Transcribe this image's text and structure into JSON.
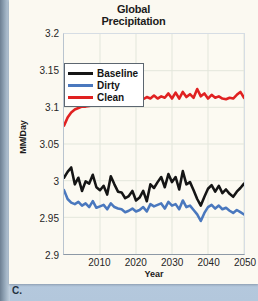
{
  "figure": {
    "caption_letter": "C.",
    "panel_background": "#fbf9f1",
    "page_background": "#bed0e2"
  },
  "chart_data": {
    "type": "line",
    "title": "Global Precipitation",
    "title_lines": [
      "Global",
      "Precipitation"
    ],
    "xlabel": "Year",
    "ylabel": "MM/Day",
    "xlim": [
      2000,
      2050
    ],
    "ylim": [
      2.9,
      3.2
    ],
    "grid": true,
    "legend_position": "upper-left-inside",
    "xticks": [
      2010,
      2020,
      2030,
      2040,
      2050
    ],
    "xtick_labels": [
      "2010",
      "2020",
      "2030",
      "2040",
      "2050"
    ],
    "yticks": [
      2.9,
      2.95,
      3.0,
      3.05,
      3.1,
      3.15,
      3.2
    ],
    "ytick_labels": [
      "2.9",
      "2.95",
      "3",
      "3.05",
      "3.1",
      "3.15",
      "3.2"
    ],
    "x": [
      2000,
      2001,
      2002,
      2003,
      2004,
      2005,
      2006,
      2007,
      2008,
      2009,
      2010,
      2011,
      2012,
      2013,
      2014,
      2015,
      2016,
      2017,
      2018,
      2019,
      2020,
      2021,
      2022,
      2023,
      2024,
      2025,
      2026,
      2027,
      2028,
      2029,
      2030,
      2031,
      2032,
      2033,
      2034,
      2035,
      2036,
      2037,
      2038,
      2039,
      2040,
      2041,
      2042,
      2043,
      2044,
      2045,
      2046,
      2047,
      2048,
      2049,
      2050
    ],
    "series": [
      {
        "name": "Baseline",
        "color": "#151515",
        "values": [
          3.004,
          3.012,
          3.018,
          2.995,
          3.004,
          2.986,
          2.999,
          2.996,
          3.008,
          2.991,
          2.987,
          2.993,
          2.981,
          3.006,
          2.995,
          2.985,
          2.984,
          2.976,
          2.979,
          2.986,
          2.973,
          2.977,
          2.986,
          2.972,
          2.995,
          2.99,
          2.998,
          3.005,
          2.991,
          3.009,
          2.998,
          3.005,
          2.988,
          3.013,
          2.995,
          2.998,
          2.987,
          2.975,
          2.966,
          2.978,
          2.989,
          2.994,
          2.985,
          2.993,
          2.983,
          2.988,
          2.982,
          2.978,
          2.985,
          2.99,
          2.996
        ]
      },
      {
        "name": "Dirty",
        "color": "#4a78be",
        "values": [
          2.987,
          2.975,
          2.97,
          2.968,
          2.971,
          2.966,
          2.969,
          2.964,
          2.972,
          2.963,
          2.965,
          2.967,
          2.961,
          2.969,
          2.964,
          2.962,
          2.961,
          2.957,
          2.959,
          2.962,
          2.958,
          2.96,
          2.964,
          2.958,
          2.968,
          2.965,
          2.967,
          2.969,
          2.962,
          2.971,
          2.966,
          2.968,
          2.961,
          2.973,
          2.964,
          2.966,
          2.96,
          2.954,
          2.945,
          2.956,
          2.964,
          2.967,
          2.962,
          2.966,
          2.961,
          2.963,
          2.959,
          2.956,
          2.96,
          2.957,
          2.954
        ]
      },
      {
        "name": "Clean",
        "color": "#e02121",
        "values": [
          3.075,
          3.086,
          3.093,
          3.097,
          3.099,
          3.101,
          3.101,
          3.102,
          3.103,
          3.104,
          3.104,
          3.105,
          3.105,
          3.106,
          3.107,
          3.107,
          3.108,
          3.108,
          3.109,
          3.109,
          3.11,
          3.11,
          3.111,
          3.114,
          3.112,
          3.116,
          3.112,
          3.115,
          3.113,
          3.119,
          3.112,
          3.12,
          3.112,
          3.121,
          3.114,
          3.118,
          3.113,
          3.125,
          3.115,
          3.119,
          3.112,
          3.117,
          3.113,
          3.115,
          3.112,
          3.111,
          3.113,
          3.112,
          3.117,
          3.121,
          3.113
        ]
      }
    ]
  },
  "legend": {
    "items": [
      {
        "label": "Baseline",
        "color": "#151515"
      },
      {
        "label": "Dirty",
        "color": "#4a78be"
      },
      {
        "label": "Clean",
        "color": "#e02121"
      }
    ]
  }
}
